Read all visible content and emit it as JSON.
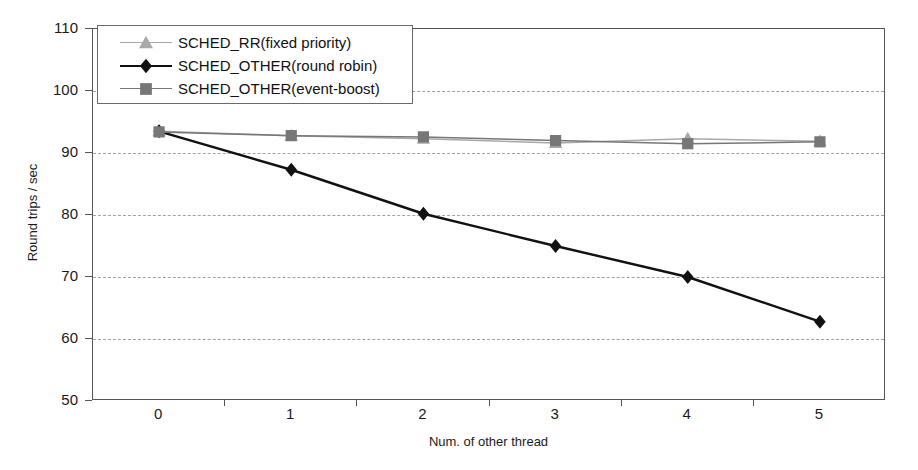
{
  "chart_data": {
    "type": "line",
    "title": "",
    "xlabel": "Num. of other thread",
    "ylabel": "Round trips / sec",
    "categories": [
      "0",
      "1",
      "2",
      "3",
      "4",
      "5"
    ],
    "ylim": [
      50,
      110
    ],
    "yticks": [
      50,
      60,
      70,
      80,
      90,
      100,
      110
    ],
    "grid": "horizontal-dashed",
    "legend_position": "upper-left-inside",
    "series": [
      {
        "name": "SCHED_RR(fixed priority)",
        "marker": "triangle",
        "color": "#a9a9a9",
        "values": [
          93.5,
          92.8,
          92.3,
          91.6,
          92.3,
          91.9
        ]
      },
      {
        "name": "SCHED_OTHER(round robin)",
        "marker": "diamond",
        "color": "#111111",
        "values": [
          93.5,
          87.3,
          80.2,
          75.0,
          70.0,
          62.8
        ]
      },
      {
        "name": "SCHED_OTHER(event-boost)",
        "marker": "square",
        "color": "#777777",
        "values": [
          93.4,
          92.8,
          92.6,
          92.0,
          91.5,
          91.8
        ]
      }
    ]
  }
}
